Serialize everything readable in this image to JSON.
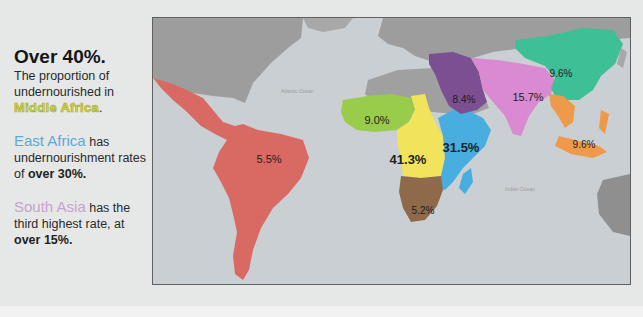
{
  "left_panel": {
    "headline": "Over 40%.",
    "para1_text": "The proportion of undernourished in",
    "para1_highlight": "Middle Africa",
    "para1_end": ".",
    "para2_highlight": "East Africa",
    "para2_text": " has undernourishment rates of ",
    "para2_bold": "over 30%.",
    "para3_highlight": "South Asia",
    "para3_text": " has the third highest rate, at ",
    "para3_bold": "over 15%."
  },
  "map": {
    "ocean_labels": [
      "Atlantic Ocean",
      "Indian Ocean"
    ],
    "regions": [
      {
        "name": "Latin America",
        "value": "5.5%",
        "color": "#d96a63"
      },
      {
        "name": "West Africa",
        "value": "9.0%",
        "color": "#98cc4a"
      },
      {
        "name": "Middle Africa",
        "value": "41.3%",
        "color": "#f2e35c"
      },
      {
        "name": "East Africa",
        "value": "31.5%",
        "color": "#47aedf"
      },
      {
        "name": "Southern Africa",
        "value": "5.2%",
        "color": "#8f6a4a"
      },
      {
        "name": "Western Asia",
        "value": "8.4%",
        "color": "#7c4f92"
      },
      {
        "name": "South Asia",
        "value": "15.7%",
        "color": "#d98ad0"
      },
      {
        "name": "East Asia",
        "value": "9.6%",
        "color": "#3fbf95"
      },
      {
        "name": "South-East Asia",
        "value": "9.6%",
        "color": "#ee9a4a"
      }
    ],
    "colors": {
      "ocean": "#c9cfd2",
      "land": "#9d9d9d",
      "frame": "#606060"
    }
  }
}
